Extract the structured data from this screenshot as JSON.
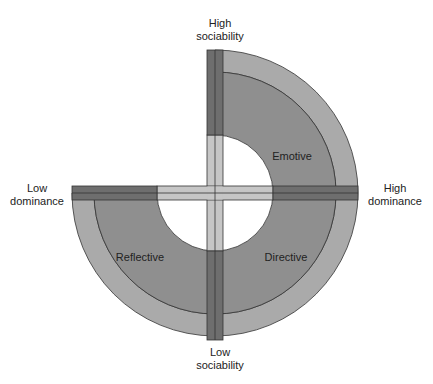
{
  "diagram": {
    "type": "social-style-quadrant",
    "axes": {
      "top": "High sociability",
      "top_line1": "High",
      "top_line2": "sociability",
      "bottom_line1": "Low",
      "bottom_line2": "sociability",
      "left_line1": "Low",
      "left_line2": "dominance",
      "right_line1": "High",
      "right_line2": "dominance"
    },
    "quadrants": [
      {
        "position": "top-right",
        "label": "Emotive"
      },
      {
        "position": "bottom-left",
        "label": "Reflective"
      },
      {
        "position": "bottom-right",
        "label": "Directive"
      }
    ],
    "colors": {
      "outer_ring": "#aaaaaa",
      "inner_ring": "#8f8f8f",
      "axis_bar_dark": "#6e6e6e",
      "axis_bar_light": "#c6c6c6",
      "outline": "#333333"
    }
  }
}
